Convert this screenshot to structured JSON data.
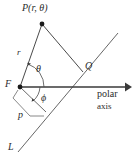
{
  "figure": {
    "type": "geometry-diagram",
    "width": 134,
    "height": 160,
    "background_color": "#ffffff",
    "stroke_color": "#4a4a4a",
    "text_color": "#2b2b2b",
    "labels": {
      "point_p": "P(r, θ)",
      "segment_r": "r",
      "angle_theta": "θ",
      "point_f": "F",
      "angle_phi": "ϕ",
      "distance_p": "p",
      "point_q": "Q",
      "line_l": "L",
      "axis_line1": "polar",
      "axis_line2": "axis"
    },
    "points": {
      "P": {
        "x": 42,
        "y": 24
      },
      "F": {
        "x": 20,
        "y": 87
      },
      "Q": {
        "x": 83,
        "y": 72
      },
      "foot_of_perpendicular": {
        "x": 46,
        "y": 112
      },
      "axis_arrow_tip": {
        "x": 129,
        "y": 87
      },
      "line_l_top": {
        "x": 118,
        "y": 33
      },
      "line_l_bottom": {
        "x": 18,
        "y": 152
      }
    },
    "segments": [
      {
        "name": "F-to-P",
        "label": "r",
        "from": "F",
        "to": "P"
      },
      {
        "name": "P-to-Q",
        "label": "",
        "from": "P",
        "to": "Q"
      },
      {
        "name": "F-to-axis-arrow",
        "label": "polar axis",
        "from": "F",
        "to": "axis_arrow_tip"
      },
      {
        "name": "F-perpendicular-to-L",
        "label": "p",
        "from": "F",
        "to": "foot_of_perpendicular"
      },
      {
        "name": "line-L",
        "label": "L",
        "from": "line_l_bottom",
        "to": "line_l_top"
      }
    ],
    "angles": [
      {
        "name": "theta",
        "label": "θ",
        "vertex": "F",
        "between": "polar axis and FP"
      },
      {
        "name": "phi",
        "label": "ϕ",
        "vertex": "F",
        "between": "polar axis and F-perpendicular"
      }
    ]
  }
}
